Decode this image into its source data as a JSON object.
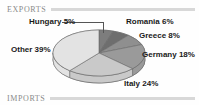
{
  "sections": {
    "exports_label": "EXPORTS",
    "imports_label": "IMPORTS"
  },
  "colors": {
    "other": "#e3e3e3",
    "italy": "#c9c9c9",
    "germany": "#9a9a9a",
    "greece": "#8f8f8f",
    "romania": "#6e6e6e",
    "hungary": "#7d7d7d",
    "rim": "#b4b4b4",
    "stroke": "#6a6a6a",
    "rule": "#d8d8d8",
    "section_text": "#8a8a8a",
    "label_text": "#1a1a1a"
  },
  "chart_data": {
    "type": "pie",
    "title": "",
    "xlabel": "",
    "ylabel": "",
    "legend_position": "none",
    "grid": false,
    "three_d": true,
    "categories": [
      "Hungary",
      "Romania",
      "Greece",
      "Germany",
      "Italy",
      "Other"
    ],
    "values": [
      5,
      6,
      8,
      18,
      24,
      39
    ],
    "unit": "%",
    "labels": [
      "Hungary 5%",
      "Romania 6%",
      "Greece 8%",
      "Germany 18%",
      "Italy 24%",
      "Other 39%"
    ],
    "slices": [
      {
        "name": "Hungary",
        "value": 5,
        "label": "Hungary 5%",
        "color": "#7d7d7d"
      },
      {
        "name": "Romania",
        "value": 6,
        "label": "Romania 6%",
        "color": "#6e6e6e"
      },
      {
        "name": "Greece",
        "value": 8,
        "label": "Greece 8%",
        "color": "#8f8f8f"
      },
      {
        "name": "Germany",
        "value": 18,
        "label": "Germany 18%",
        "color": "#9a9a9a"
      },
      {
        "name": "Italy",
        "value": 24,
        "label": "Italy 24%",
        "color": "#c9c9c9"
      },
      {
        "name": "Other",
        "value": 39,
        "label": "Other 39%",
        "color": "#e3e3e3"
      }
    ]
  }
}
